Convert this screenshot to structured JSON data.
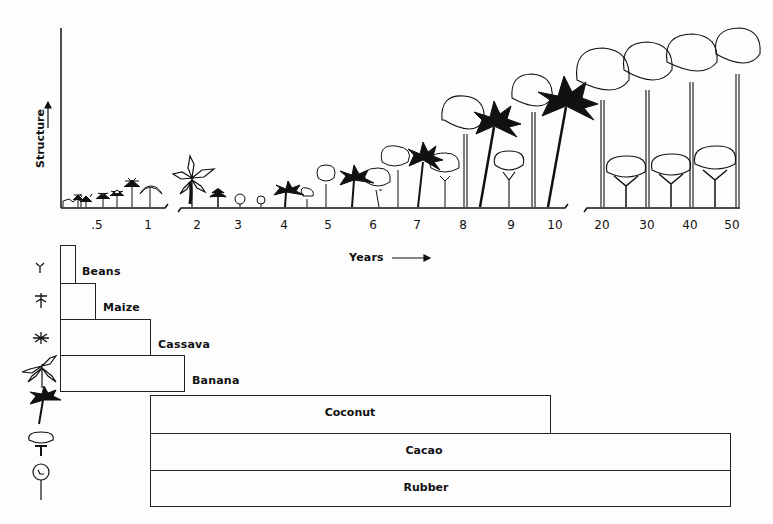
{
  "diagram": {
    "y_axis_label": "Structure",
    "x_axis_label": "Years",
    "x_ticks": [
      {
        "label": ".5",
        "x": 97
      },
      {
        "label": "1",
        "x": 148
      },
      {
        "label": "2",
        "x": 197
      },
      {
        "label": "3",
        "x": 238
      },
      {
        "label": "4",
        "x": 284
      },
      {
        "label": "5",
        "x": 328
      },
      {
        "label": "6",
        "x": 373
      },
      {
        "label": "7",
        "x": 417
      },
      {
        "label": "8",
        "x": 463
      },
      {
        "label": "9",
        "x": 511
      },
      {
        "label": "10",
        "x": 555
      },
      {
        "label": "20",
        "x": 602
      },
      {
        "label": "30",
        "x": 647
      },
      {
        "label": "40",
        "x": 690
      },
      {
        "label": "50",
        "x": 732
      }
    ],
    "crops": [
      {
        "name": "Beans",
        "icon": "bean-sprout-icon",
        "start_year": 0,
        "end_year": 0.25
      },
      {
        "name": "Maize",
        "icon": "maize-icon",
        "start_year": 0,
        "end_year": 0.6
      },
      {
        "name": "Cassava",
        "icon": "cassava-icon",
        "start_year": 0,
        "end_year": 1
      },
      {
        "name": "Banana",
        "icon": "banana-plant-icon",
        "start_year": 0,
        "end_year": 2
      },
      {
        "name": "Coconut",
        "icon": "coconut-palm-icon",
        "start_year": 1,
        "end_year": 10
      },
      {
        "name": "Cacao",
        "icon": "cacao-tree-icon",
        "start_year": 1,
        "end_year": 50
      },
      {
        "name": "Rubber",
        "icon": "rubber-tree-icon",
        "start_year": 1,
        "end_year": 50
      }
    ]
  }
}
